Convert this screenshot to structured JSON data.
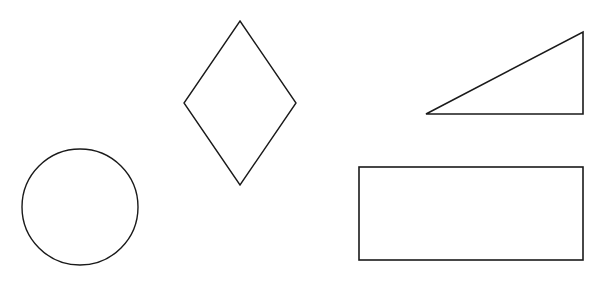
{
  "canvas": {
    "width": 604,
    "height": 281,
    "background": "#ffffff"
  },
  "style": {
    "stroke": "#1a1a1a",
    "stroke_width": 1.4,
    "fill": "none"
  },
  "shapes": {
    "circle": {
      "type": "circle",
      "cx": 80,
      "cy": 207,
      "r": 58
    },
    "diamond": {
      "type": "rhombus",
      "points": "240,21 296,103 240,185 184,103"
    },
    "triangle": {
      "type": "right-triangle",
      "points": "426,114 583,32 583,114"
    },
    "rectangle": {
      "type": "rectangle",
      "x": 359,
      "y": 167,
      "width": 224,
      "height": 93
    }
  }
}
